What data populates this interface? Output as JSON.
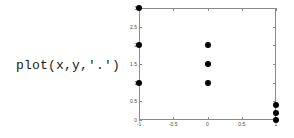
{
  "caption": {
    "code_text": "plot(x,y,'.')"
  },
  "colors": {
    "marker": "#000000",
    "axis": "#8a8a8a",
    "tick_label": "#4a4a4a",
    "background": "#ffffff",
    "caption_text": "#1a1a1a"
  },
  "chart_data": {
    "type": "scatter",
    "title": "",
    "xlabel": "",
    "ylabel": "",
    "xlim": [
      -1,
      1
    ],
    "ylim": [
      0,
      3
    ],
    "grid": false,
    "legend": false,
    "marker_style": ".",
    "marker_color": "#000000",
    "xticks": [
      -1,
      -0.5,
      0,
      0.5,
      1
    ],
    "xticklabels": [
      "-1",
      "-0.5",
      "0",
      "0.5",
      "1"
    ],
    "yticks": [
      0,
      0.5,
      1,
      1.5,
      2,
      2.5,
      3
    ],
    "yticklabels": [
      "0",
      "0.5",
      "1",
      "1.5",
      "2",
      "2.5",
      "3"
    ],
    "x": [
      -1,
      -1,
      -1,
      0,
      0,
      0,
      1,
      1,
      1
    ],
    "y": [
      1,
      2,
      3,
      1,
      1.5,
      2,
      0,
      0.2,
      0.4
    ],
    "points": [
      {
        "x": -1,
        "y": 3
      },
      {
        "x": -1,
        "y": 2
      },
      {
        "x": -1,
        "y": 1
      },
      {
        "x": 0,
        "y": 2
      },
      {
        "x": 0,
        "y": 1.5
      },
      {
        "x": 0,
        "y": 1
      },
      {
        "x": 1,
        "y": 0.4
      },
      {
        "x": 1,
        "y": 0.2
      },
      {
        "x": 1,
        "y": 0
      }
    ]
  }
}
